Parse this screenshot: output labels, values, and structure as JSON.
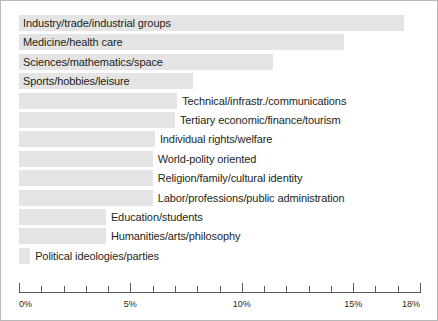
{
  "chart_data": {
    "type": "bar",
    "orientation": "horizontal",
    "title": "",
    "subtitle": "",
    "xlabel": "",
    "ylabel": "",
    "xlim": [
      0,
      18
    ],
    "grid": false,
    "legend": null,
    "x_tick_labels": [
      "0%",
      "5%",
      "10%",
      "15%",
      "18%"
    ],
    "x_major_ticks": [
      0,
      5,
      10,
      15,
      18
    ],
    "x_minor_tick_step": 1,
    "value_unit": "%",
    "bar_color": "#e4e4e4",
    "axis_color": "#58595b",
    "text_color": "#231f20",
    "categories": [
      "Industry/trade/industrial groups",
      "Medicine/health care",
      "Sciences/mathematics/space",
      "Sports/hobbies/leisure",
      "Technical/infrastr./communications",
      "Tertiary economic/finance/tourism",
      "Individual rights/welfare",
      "World-polity oriented",
      "Religion/family/cultural identity",
      "Labor/professions/public administration",
      "Education/students",
      "Humanities/arts/philosophy",
      "Political ideologies/parties"
    ],
    "values": [
      17.3,
      14.6,
      11.4,
      7.8,
      7.1,
      7.0,
      6.1,
      6.0,
      6.0,
      6.0,
      3.9,
      3.9,
      0.5
    ],
    "label_placement": [
      "inside",
      "inside",
      "inside",
      "inside",
      "outside",
      "outside",
      "outside",
      "outside",
      "outside",
      "outside",
      "outside",
      "outside",
      "outside"
    ]
  }
}
